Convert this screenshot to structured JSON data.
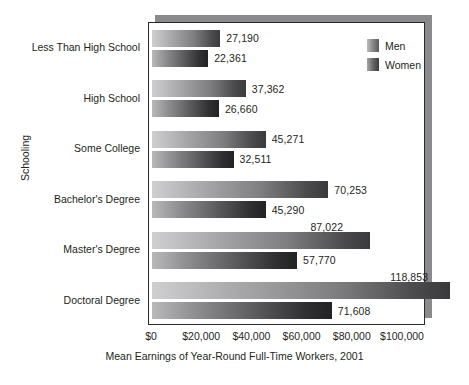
{
  "chart_data": {
    "type": "bar",
    "orientation": "horizontal",
    "title": "",
    "xlabel": "Mean Earnings of Year-Round Full-Time Workers, 2001",
    "ylabel": "Schooling",
    "xlim": [
      0,
      118853
    ],
    "xticks": [
      0,
      20000,
      40000,
      60000,
      80000,
      100000
    ],
    "xtick_labels": [
      "$0",
      "$20,000",
      "$40,000",
      "$60,000",
      "$80,000",
      "$100,000"
    ],
    "grid": false,
    "legend_position": "top-right",
    "categories": [
      "Less Than High School",
      "High School",
      "Some College",
      "Bachelor's Degree",
      "Master's Degree",
      "Doctoral Degree"
    ],
    "series": [
      {
        "name": "Men",
        "color": "#8c8c8e",
        "values": [
          27190,
          37362,
          45271,
          70253,
          87022,
          118853
        ],
        "value_labels": [
          "27,190",
          "37,362",
          "45,271",
          "70,253",
          "87,022",
          "118,853"
        ]
      },
      {
        "name": "Women",
        "color": "#4a4a4c",
        "values": [
          22361,
          26660,
          32511,
          45290,
          57770,
          71608
        ],
        "value_labels": [
          "22,361",
          "26,660",
          "32,511",
          "45,290",
          "57,770",
          "71,608"
        ]
      }
    ]
  },
  "legend": {
    "items": [
      {
        "label": "Men",
        "swatch": "men"
      },
      {
        "label": "Women",
        "swatch": "women"
      }
    ]
  }
}
